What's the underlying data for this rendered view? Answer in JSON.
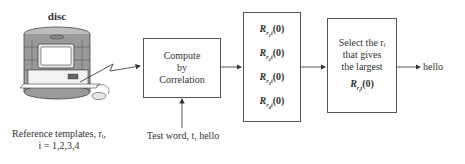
{
  "disc": {
    "label": "disc",
    "caption_line1": "Reference templates, rᵢ,",
    "caption_line2": "i = 1,2,3,4"
  },
  "compute_box": {
    "line1": "Compute",
    "line2": "by",
    "line3": "Correlation"
  },
  "test_input": {
    "label": "Test word, t, hello"
  },
  "correlation_box": {
    "terms": [
      {
        "base": "R",
        "sub_outer": "r",
        "sub_inner": "1",
        "sub_tail": "t",
        "arg": "(0)"
      },
      {
        "base": "R",
        "sub_outer": "r",
        "sub_inner": "2",
        "sub_tail": "t",
        "arg": "(0)"
      },
      {
        "base": "R",
        "sub_outer": "r",
        "sub_inner": "3",
        "sub_tail": "t",
        "arg": "(0)"
      },
      {
        "base": "R",
        "sub_outer": "r",
        "sub_inner": "4",
        "sub_tail": "t",
        "arg": "(0)"
      }
    ]
  },
  "select_box": {
    "line1": "Select the rᵢ",
    "line2": "that gives",
    "line3": "the largest",
    "term": {
      "base": "R",
      "sub_outer": "r",
      "sub_inner": "i",
      "sub_tail": "t",
      "arg": "(0)"
    }
  },
  "output": {
    "label": "hello"
  },
  "colors": {
    "line": "#444444",
    "disc_body": "#9a9a9a",
    "disc_light": "#d8d8d8"
  }
}
